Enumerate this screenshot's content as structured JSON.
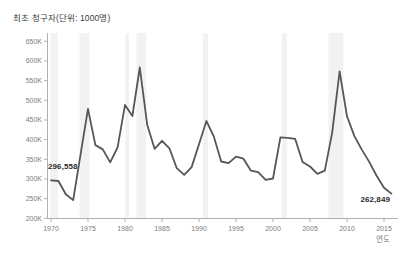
{
  "chart_data": {
    "type": "line",
    "title": "최초 청구자(단위: 1000명)",
    "xlabel": "연도",
    "ylabel": "",
    "unit_suffix": "K",
    "first_point_label": "296,558",
    "last_point_label": "262,849",
    "x_ticks": [
      1970,
      1975,
      1980,
      1985,
      1990,
      1995,
      2000,
      2005,
      2010,
      2015
    ],
    "y_ticks": [
      200,
      250,
      300,
      350,
      400,
      450,
      500,
      550,
      600,
      650
    ],
    "ylim": [
      200,
      650
    ],
    "xlim": [
      1969.5,
      2016.9
    ],
    "grid": false,
    "legend": false,
    "years": [
      1970,
      1971,
      1972,
      1973,
      1974,
      1975,
      1976,
      1977,
      1978,
      1979,
      1980,
      1981,
      1982,
      1983,
      1984,
      1985,
      1986,
      1987,
      1988,
      1989,
      1990,
      1991,
      1992,
      1993,
      1994,
      1995,
      1996,
      1997,
      1998,
      1999,
      2000,
      2001,
      2002,
      2003,
      2004,
      2005,
      2006,
      2007,
      2008,
      2009,
      2010,
      2011,
      2012,
      2013,
      2014,
      2015,
      2016
    ],
    "values_thousands": [
      296.558,
      294.9,
      261.1,
      246.4,
      363.2,
      478.1,
      386.1,
      375.2,
      342.1,
      380.3,
      488.3,
      460.0,
      583.4,
      438.1,
      376.7,
      397.1,
      378.0,
      327.5,
      310.4,
      330.1,
      388.2,
      447.3,
      408.3,
      344.3,
      340.1,
      357.0,
      351.5,
      321.4,
      317.2,
      297.9,
      301.2,
      406.0,
      404.3,
      402.0,
      343.2,
      331.6,
      312.9,
      321.2,
      418.0,
      573.5,
      459.3,
      409.1,
      374.6,
      343.3,
      308.4,
      277.9,
      262.849
    ],
    "recession_bands": [
      [
        1969.92,
        1970.92
      ],
      [
        1973.87,
        1975.21
      ],
      [
        1980.04,
        1980.54
      ],
      [
        1981.54,
        1982.87
      ],
      [
        1990.54,
        1991.21
      ],
      [
        2001.21,
        2001.87
      ],
      [
        2007.5,
        2009.5
      ]
    ],
    "colors": {
      "line": "#565658",
      "band": "#ececec",
      "axis": "#b0b0b0",
      "tick_label": "#7d7d7d",
      "title": "#3b3b3b",
      "annotation": "#2b2b2b",
      "background": "#ffffff"
    }
  }
}
